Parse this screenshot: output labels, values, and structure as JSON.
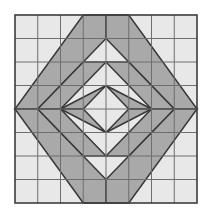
{
  "figure": {
    "type": "geometric-quilt-block",
    "canvas_width": 212,
    "canvas_height": 220,
    "background_color": "#ffffff"
  },
  "grid": {
    "origin_x": 15,
    "origin_y": 15,
    "width": 182,
    "height": 188,
    "columns": 8,
    "rows": 8,
    "cell_width": 22.75,
    "cell_height": 23.5,
    "cell_fill": "#e8e8e8",
    "line_color": "#6e6e6e",
    "line_width": 1,
    "border_color": "#3c3c3c",
    "border_width": 1.6
  },
  "shapes": {
    "shaded_fill": "#a9a9a9",
    "shaded_stroke": "#383838",
    "shaded_stroke_width": 1.5
  },
  "quadrants": [
    {
      "name": "top-left",
      "origin_col": 0,
      "origin_row": 0,
      "flip_x": false,
      "flip_y": false,
      "direction": "ascending"
    },
    {
      "name": "top-right",
      "origin_col": 4,
      "origin_row": 0,
      "flip_x": true,
      "flip_y": false,
      "direction": "descending"
    },
    {
      "name": "bottom-left",
      "origin_col": 0,
      "origin_row": 4,
      "flip_x": false,
      "flip_y": true,
      "direction": "descending"
    },
    {
      "name": "bottom-right",
      "origin_col": 4,
      "origin_row": 4,
      "flip_x": true,
      "flip_y": true,
      "direction": "ascending"
    }
  ],
  "quadrant_motif": {
    "description": "Unit 4x4 quadrant in local coords (0..4 on each axis), y measured downward from quadrant top. Three parallel diagonal bands running from lower-left to upper-right, decreasing in length, plus corner triangles.",
    "polygons": [
      {
        "name": "band-long",
        "points": [
          [
            0,
            4
          ],
          [
            1,
            4
          ],
          [
            4,
            1
          ],
          [
            4,
            0
          ],
          [
            3,
            0
          ]
        ]
      },
      {
        "name": "band-medium",
        "points": [
          [
            1,
            4
          ],
          [
            2,
            4
          ],
          [
            4,
            2
          ],
          [
            3,
            2
          ]
        ]
      },
      {
        "name": "band-short",
        "points": [
          [
            2,
            4
          ],
          [
            3,
            4
          ],
          [
            4,
            3
          ],
          [
            4,
            3
          ]
        ]
      },
      {
        "name": "triangle-corner",
        "points": [
          [
            2,
            4
          ],
          [
            4,
            4
          ],
          [
            4,
            2
          ]
        ]
      }
    ]
  },
  "legend": {
    "shaded_label": "shaded patch",
    "plain_label": "plain patch"
  }
}
